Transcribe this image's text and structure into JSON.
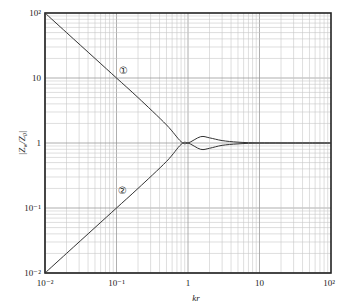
{
  "chart_data": {
    "type": "line",
    "title": "",
    "xlabel": "kr",
    "ylabel": "|Z_w/Z_0|",
    "xscale": "log",
    "yscale": "log",
    "xlim": [
      0.01,
      100
    ],
    "ylim": [
      0.01,
      100
    ],
    "grid": true,
    "legend": "none (curves annotated with circled numbers ① and ②)",
    "x_ticks": [
      {
        "value": 0.01,
        "label": "10⁻²"
      },
      {
        "value": 0.1,
        "label": "10⁻¹"
      },
      {
        "value": 1,
        "label": "1"
      },
      {
        "value": 10,
        "label": "10"
      },
      {
        "value": 100,
        "label": "10²"
      }
    ],
    "y_ticks": [
      {
        "value": 0.01,
        "label": "10⁻²"
      },
      {
        "value": 0.1,
        "label": "10⁻¹"
      },
      {
        "value": 1,
        "label": "1"
      },
      {
        "value": 10,
        "label": "10"
      },
      {
        "value": 100,
        "label": "10²"
      }
    ],
    "x": [
      0.01,
      0.02,
      0.05,
      0.1,
      0.2,
      0.5,
      0.8,
      1,
      1.5,
      2,
      3,
      5,
      10,
      20,
      50,
      100
    ],
    "series": [
      {
        "name": "①",
        "values": [
          100,
          50,
          20,
          10,
          5,
          1.9,
          1.05,
          1.0,
          1.25,
          1.2,
          1.09,
          1.03,
          1.0,
          1.0,
          1.0,
          1.0
        ]
      },
      {
        "name": "②",
        "values": [
          0.01,
          0.02,
          0.05,
          0.1,
          0.2,
          0.52,
          0.95,
          1.0,
          0.8,
          0.83,
          0.92,
          0.97,
          1.0,
          1.0,
          1.0,
          1.0
        ]
      }
    ],
    "annotations": [
      {
        "text": "①",
        "x": 0.12,
        "y": 9.5
      },
      {
        "text": "②",
        "x": 0.12,
        "y": 0.12
      }
    ]
  },
  "labels": {
    "xlabel": "kr",
    "ylabel_main": "|Z",
    "ylabel_sub1": "w",
    "ylabel_mid": "/Z",
    "ylabel_sub2": "0",
    "ylabel_end": "|",
    "curve1": "①",
    "curve2": "②",
    "xticks": [
      "10⁻²",
      "10⁻¹",
      "1",
      "10",
      "10²"
    ],
    "yticks": [
      "10⁻²",
      "10⁻¹",
      "1",
      "10",
      "10²"
    ]
  }
}
